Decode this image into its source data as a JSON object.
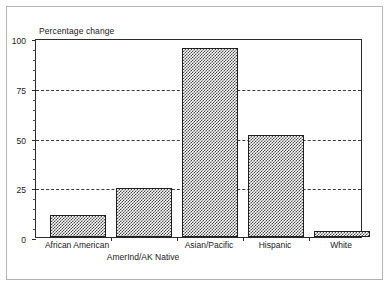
{
  "chart_data": {
    "type": "bar",
    "title": "",
    "subtitle": "",
    "xlabel": "",
    "ylabel": "Percentage change",
    "ylim": [
      0,
      100
    ],
    "yticks": [
      0,
      25,
      50,
      75,
      100
    ],
    "ytick_labels": [
      "0",
      "25",
      "50",
      "75",
      "100"
    ],
    "grid": "horizontal-dashed-at-25-50-75",
    "legend": "none",
    "categories": [
      "African American",
      "AmerInd/AK Native",
      "Asian/Pacific",
      "Hispanic",
      "White"
    ],
    "values": [
      11,
      25,
      96,
      52,
      3
    ],
    "bar_fill": "checkerboard-hatch",
    "bar_edge_color": "#1f1f1f"
  },
  "axes": {
    "y_title": "Percentage change",
    "y_tick_labels": [
      "100",
      "75",
      "50",
      "25",
      "0"
    ],
    "x_tick_labels": [
      "African American",
      "AmerInd/AK Native",
      "Asian/Pacific",
      "Hispanic",
      "White"
    ]
  },
  "colors": {
    "frame": "#b3b3b3",
    "axis": "#2b2b2b",
    "gridline": "#3a3a3a",
    "bar_hatch": "#4a4a4a",
    "background": "#ffffff",
    "text": "#1a1a1a"
  }
}
